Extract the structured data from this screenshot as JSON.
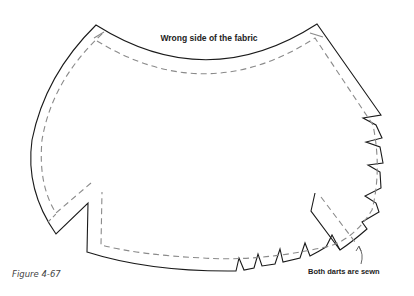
{
  "figure": {
    "title": "Wrong side of the fabric",
    "annotation": "Both darts are sewn",
    "caption": "Figure 4-67",
    "colors": {
      "cut_line": "#1a1a1a",
      "stitch_line": "#8a8a8a",
      "background": "#ffffff"
    },
    "elements": [
      {
        "type": "cut-line",
        "style": "solid"
      },
      {
        "type": "stitching-line",
        "style": "dashed"
      },
      {
        "type": "dart-notches",
        "location": "right edge and bottom edge"
      },
      {
        "type": "arrow",
        "points_to": "sewn dart"
      }
    ]
  }
}
